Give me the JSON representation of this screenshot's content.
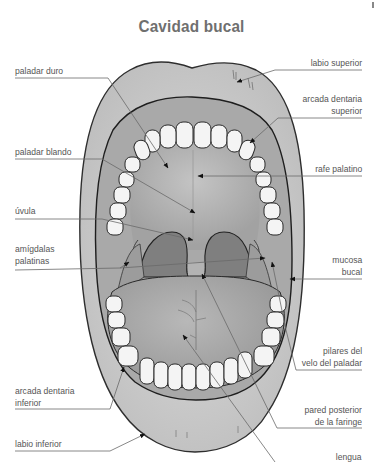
{
  "title": "Cavidad bucal",
  "labels": {
    "labio_superior": "labio superior",
    "arcada_dentaria_superior": [
      "arcada dentaria",
      "superior"
    ],
    "paladar_duro": "paladar duro",
    "paladar_blando": "paladar blando",
    "rafe_palatino": "rafe palatino",
    "uvula": "úvula",
    "amigdalas_palatinas": [
      "amígdalas",
      "palatinas"
    ],
    "mucosa_bucal": [
      "mucosa",
      "bucal"
    ],
    "pilares_velo": [
      "pilares del",
      "velo del paladar"
    ],
    "arcada_dentaria_inferior": [
      "arcada dentaria",
      "inferior"
    ],
    "pared_posterior": [
      "pared posterior",
      "de la faringe"
    ],
    "labio_inferior": "labio inferior",
    "lengua": "lengua"
  },
  "colors": {
    "title": "#6f6f6f",
    "label_text": "#555555",
    "leader_line": "#6a6a6a",
    "lip": "#c9c9c9",
    "mouth_interior": "#a8a8a8",
    "palate": "#b5b5b5",
    "throat": "#7e7e7e",
    "tongue": "#a3a3a3",
    "teeth": "#f4f4f4",
    "outline": "#2e2e2e"
  }
}
